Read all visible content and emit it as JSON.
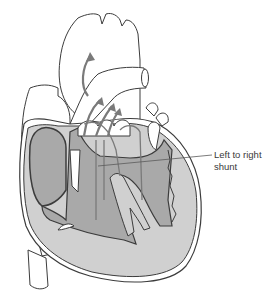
{
  "diagram": {
    "labels": [
      {
        "id": "shunt",
        "line1": "Left to right",
        "line2": "shunt"
      }
    ],
    "colors": {
      "outline": "#3c3c3c",
      "chamber_dark": "#a9a9a9",
      "myocardium_light": "#d0d0d0",
      "vessel_fill": "#ffffff",
      "arrow": "#7a7a7a",
      "background": "#ffffff"
    }
  }
}
